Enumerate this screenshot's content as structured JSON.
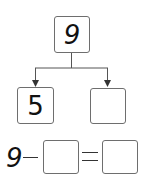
{
  "diagram": {
    "whole": "9",
    "part_left": "5",
    "part_right": ""
  },
  "equation": {
    "minuend": "9",
    "operator": "−",
    "subtrahend": "",
    "equals": "=",
    "result": ""
  }
}
